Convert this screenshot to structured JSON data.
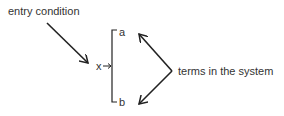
{
  "diagram": {
    "entry_label": "entry condition",
    "variable_label": "x",
    "arrow_glyph": "→",
    "term_a": "a",
    "term_b": "b",
    "terms_label": "terms in the system",
    "stroke_color": "#222222"
  }
}
